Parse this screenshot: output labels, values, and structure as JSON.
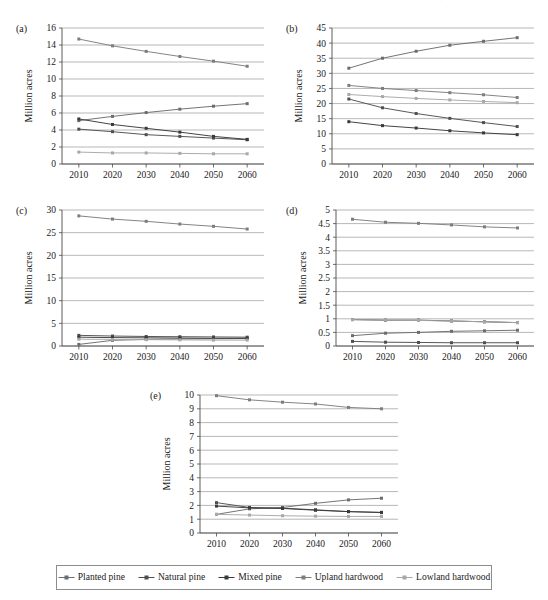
{
  "figure": {
    "yaxis_title": "Million acres",
    "series_colors": {
      "planted_pine": "#6d6d6d",
      "natural_pine": "#4f4f4f",
      "mixed_pine": "#3a3a3a",
      "upland_hardwood": "#7d7d7d",
      "lowland_hardwood": "#a8a8a8"
    },
    "series_names": [
      "Planted pine",
      "Natural pine",
      "Mixed pine",
      "Upland hardwood",
      "Lowland hardwood"
    ]
  },
  "legend": {
    "items": [
      {
        "label": "Planted pine",
        "marker": "line-square-marker",
        "color": "#6d6d6d"
      },
      {
        "label": "Natural pine",
        "marker": "line-square-marker",
        "color": "#4f4f4f"
      },
      {
        "label": "Mixed pine",
        "marker": "line-square-marker",
        "color": "#3a3a3a"
      },
      {
        "label": "Upland hardwood",
        "marker": "line-square-marker",
        "color": "#7d7d7d"
      },
      {
        "label": "Lowland hardwood",
        "marker": "line-square-marker",
        "color": "#a8a8a8"
      }
    ]
  },
  "chart_data": [
    {
      "id": "a",
      "panel_letter": "(a)",
      "type": "line",
      "title": "",
      "xlabel": "",
      "ylabel": "Million acres",
      "x": [
        2010,
        2020,
        2030,
        2040,
        2050,
        2060
      ],
      "xlim": [
        2005,
        2065
      ],
      "ylim": [
        0,
        16
      ],
      "yticks": [
        0,
        2,
        4,
        6,
        8,
        10,
        12,
        14,
        16
      ],
      "grid": true,
      "legend_position": "figure-bottom",
      "series": [
        {
          "name": "Planted pine",
          "values": [
            5.1,
            5.6,
            6.05,
            6.45,
            6.8,
            7.1
          ]
        },
        {
          "name": "Natural pine",
          "values": [
            4.1,
            3.8,
            3.45,
            3.25,
            3.05,
            2.85
          ]
        },
        {
          "name": "Mixed pine",
          "values": [
            5.3,
            4.65,
            4.2,
            3.75,
            3.25,
            2.9
          ]
        },
        {
          "name": "Upland hardwood",
          "values": [
            14.7,
            13.9,
            13.25,
            12.65,
            12.1,
            11.5
          ]
        },
        {
          "name": "Lowland hardwood",
          "values": [
            1.4,
            1.3,
            1.3,
            1.25,
            1.2,
            1.2
          ]
        }
      ]
    },
    {
      "id": "b",
      "panel_letter": "(b)",
      "type": "line",
      "title": "",
      "xlabel": "",
      "ylabel": "Million acres",
      "x": [
        2010,
        2020,
        2030,
        2040,
        2050,
        2060
      ],
      "xlim": [
        2005,
        2065
      ],
      "ylim": [
        0,
        45
      ],
      "yticks": [
        0,
        5,
        10,
        15,
        20,
        25,
        30,
        35,
        40,
        45
      ],
      "grid": true,
      "legend_position": "figure-bottom",
      "series": [
        {
          "name": "Planted pine",
          "values": [
            31.7,
            35.0,
            37.3,
            39.3,
            40.6,
            41.8
          ]
        },
        {
          "name": "Natural pine",
          "values": [
            21.5,
            18.6,
            16.7,
            15.1,
            13.7,
            12.4
          ]
        },
        {
          "name": "Mixed pine",
          "values": [
            14.0,
            12.7,
            11.9,
            11.0,
            10.3,
            9.7
          ]
        },
        {
          "name": "Upland hardwood",
          "values": [
            26.0,
            25.0,
            24.3,
            23.6,
            22.9,
            22.0
          ]
        },
        {
          "name": "Lowland hardwood",
          "values": [
            23.0,
            22.3,
            21.7,
            21.2,
            20.7,
            20.3
          ]
        }
      ]
    },
    {
      "id": "c",
      "panel_letter": "(c)",
      "type": "line",
      "title": "",
      "xlabel": "",
      "ylabel": "Million acres",
      "x": [
        2010,
        2020,
        2030,
        2040,
        2050,
        2060
      ],
      "xlim": [
        2005,
        2065
      ],
      "ylim": [
        0,
        30
      ],
      "yticks": [
        0,
        5,
        10,
        15,
        20,
        25,
        30
      ],
      "grid": true,
      "legend_position": "figure-bottom",
      "series": [
        {
          "name": "Planted pine",
          "values": [
            0.35,
            1.25,
            1.45,
            1.55,
            1.6,
            1.65
          ]
        },
        {
          "name": "Natural pine",
          "values": [
            2.35,
            2.2,
            2.1,
            2.05,
            2.0,
            1.95
          ]
        },
        {
          "name": "Mixed pine",
          "values": [
            1.95,
            1.85,
            1.8,
            1.75,
            1.7,
            1.7
          ]
        },
        {
          "name": "Upland hardwood",
          "values": [
            28.7,
            28.0,
            27.5,
            26.9,
            26.4,
            25.8
          ]
        },
        {
          "name": "Lowland hardwood",
          "values": [
            1.5,
            1.45,
            1.4,
            1.35,
            1.3,
            1.3
          ]
        }
      ]
    },
    {
      "id": "d",
      "panel_letter": "(d)",
      "type": "line",
      "title": "",
      "xlabel": "",
      "ylabel": "Million acres",
      "x": [
        2010,
        2020,
        2030,
        2040,
        2050,
        2060
      ],
      "xlim": [
        2005,
        2065
      ],
      "ylim": [
        0,
        5
      ],
      "yticks": [
        0,
        0.5,
        1,
        1.5,
        2,
        2.5,
        3,
        3.5,
        4,
        4.5,
        5
      ],
      "ytick_labels": [
        "0",
        "0.5",
        "1",
        "1.5",
        "2",
        "2.5",
        "3",
        "3.5",
        "4",
        "4.5",
        "5"
      ],
      "grid": true,
      "legend_position": "figure-bottom",
      "series": [
        {
          "name": "Planted pine",
          "values": [
            0.38,
            0.47,
            0.5,
            0.54,
            0.56,
            0.58
          ]
        },
        {
          "name": "Natural pine",
          "values": [
            0.17,
            0.14,
            0.13,
            0.12,
            0.12,
            0.12
          ]
        },
        {
          "name": "Mixed pine",
          "values": [
            0.97,
            0.95,
            0.95,
            0.92,
            0.89,
            0.86
          ]
        },
        {
          "name": "Upland hardwood",
          "values": [
            4.66,
            4.55,
            4.51,
            4.45,
            4.38,
            4.34
          ]
        },
        {
          "name": "Lowland hardwood",
          "values": [
            0.97,
            0.95,
            0.94,
            0.92,
            0.89,
            0.86
          ]
        }
      ]
    },
    {
      "id": "e",
      "panel_letter": "(e)",
      "type": "line",
      "title": "",
      "xlabel": "",
      "ylabel": "Million acres",
      "x": [
        2010,
        2020,
        2030,
        2040,
        2050,
        2060
      ],
      "xlim": [
        2005,
        2065
      ],
      "ylim": [
        0,
        10
      ],
      "yticks": [
        0,
        1,
        2,
        3,
        4,
        5,
        6,
        7,
        8,
        9,
        10
      ],
      "grid": true,
      "legend_position": "figure-bottom",
      "series": [
        {
          "name": "Planted pine",
          "values": [
            1.35,
            1.75,
            1.85,
            2.15,
            2.4,
            2.52
          ]
        },
        {
          "name": "Natural pine",
          "values": [
            2.2,
            1.85,
            1.8,
            1.68,
            1.55,
            1.5
          ]
        },
        {
          "name": "Mixed pine",
          "values": [
            1.95,
            1.82,
            1.78,
            1.65,
            1.55,
            1.48
          ]
        },
        {
          "name": "Upland hardwood",
          "values": [
            9.95,
            9.65,
            9.48,
            9.35,
            9.1,
            9.0
          ]
        },
        {
          "name": "Lowland hardwood",
          "values": [
            1.35,
            1.3,
            1.25,
            1.22,
            1.2,
            1.2
          ]
        }
      ]
    }
  ]
}
